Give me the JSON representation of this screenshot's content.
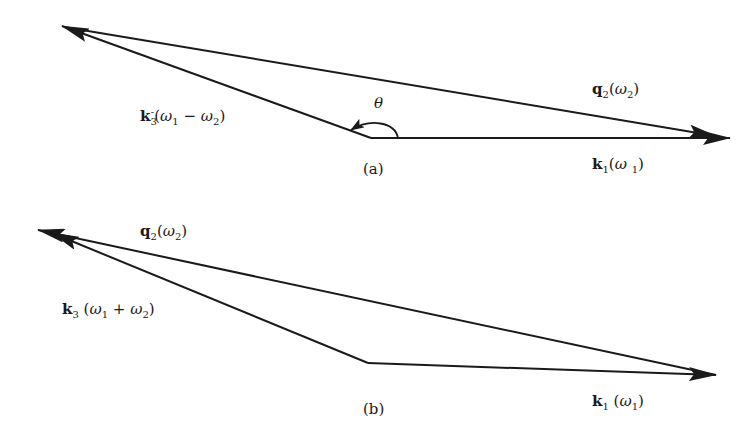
{
  "diagram": {
    "type": "vector-wavevector-triangles",
    "panels": [
      {
        "id": "a",
        "caption": "(a)",
        "vectors": [
          {
            "name": "k1",
            "symbol": "k",
            "subscript": "1",
            "superscript": "",
            "argument_open": "(",
            "omega": "ω",
            "omega_sub": "1",
            "argument_close": ")",
            "label": "k1(ω1)",
            "from": [
              371,
              138
            ],
            "to": [
              730,
              138
            ]
          },
          {
            "name": "q2",
            "symbol": "q",
            "subscript": "2",
            "superscript": "",
            "omega": "ω",
            "omega_sub": "2",
            "label": "q2(ω2)",
            "from": [
              62,
              26
            ],
            "to": [
              730,
              138
            ]
          },
          {
            "name": "k3-minus",
            "symbol": "k",
            "subscript": "3",
            "superscript": "-",
            "omega1": "ω",
            "omega1_sub": "1",
            "operator": "−",
            "omega2": "ω",
            "omega2_sub": "2",
            "label": "k3⁻(ω1 − ω2)",
            "from": [
              371,
              138
            ],
            "to": [
              62,
              26
            ]
          }
        ],
        "angle_label": "θ"
      },
      {
        "id": "b",
        "caption": "(b)",
        "vectors": [
          {
            "name": "k1",
            "symbol": "k",
            "subscript": "1",
            "omega": "ω",
            "omega_sub": "1",
            "label": "k1(ω1)",
            "from": [
              368,
              363
            ],
            "to": [
              716,
              375
            ]
          },
          {
            "name": "q2",
            "symbol": "q",
            "subscript": "2",
            "omega": "ω",
            "omega_sub": "2",
            "label": "q2(ω2)",
            "from": [
              716,
              375
            ],
            "to": [
              38,
              230
            ]
          },
          {
            "name": "k3-plus",
            "symbol": "k",
            "subscript": "3",
            "omega1": "ω",
            "omega1_sub": "1",
            "operator": "+",
            "omega2": "ω",
            "omega2_sub": "2",
            "label": "k3(ω1 + ω2)",
            "from": [
              368,
              363
            ],
            "to": [
              52,
              233
            ]
          }
        ]
      }
    ],
    "paren_open": "(",
    "paren_close": ")",
    "line_color": "#1a1a1a"
  }
}
